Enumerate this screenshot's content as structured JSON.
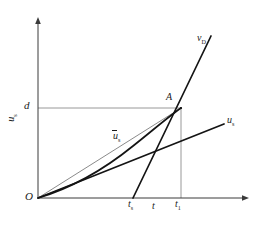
{
  "figure": {
    "kind": "line-diagram",
    "background": "#ffffff",
    "ink_color": "#1a1a1a",
    "guide_color": "#8c8c8c",
    "axes": {
      "origin_label": "O",
      "x_axis_label": "t",
      "y_axis_label": "u",
      "y_axis_label_sub": "s",
      "x_axis_arrow": true,
      "y_axis_arrow": true
    },
    "value_labels": {
      "d": "d",
      "t_s": "t",
      "t_s_sub": "s",
      "t_1": "t",
      "t_1_sub": "1"
    },
    "curves": [
      {
        "name": "v_D",
        "label": "v",
        "label_sub": "D",
        "style": "thick"
      },
      {
        "name": "u_s",
        "label": "u",
        "label_sub": "s",
        "style": "thick"
      },
      {
        "name": "u_s_mean",
        "label": "u",
        "label_sub": "s",
        "style": "thin-gray",
        "overbar": true
      },
      {
        "name": "settlement-curve",
        "label": "",
        "label_sub": "",
        "style": "thick"
      }
    ],
    "points": [
      {
        "name": "A",
        "label": "A"
      }
    ],
    "guides": [
      {
        "name": "d-horizontal-guide"
      },
      {
        "name": "t1-vertical-guide"
      }
    ],
    "caption": ""
  }
}
